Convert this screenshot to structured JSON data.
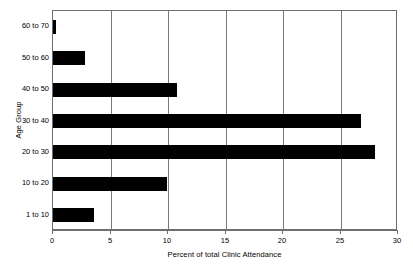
{
  "chart_data": {
    "type": "bar",
    "orientation": "horizontal",
    "title": "",
    "xlabel": "Percent of total Clinic Attendance",
    "ylabel": "Age Group",
    "categories": [
      "1 to 10",
      "10 to 20",
      "20 to 30",
      "30 to 40",
      "40 to 50",
      "50 to 60",
      "60 to 70"
    ],
    "values": [
      3.6,
      9.9,
      28.0,
      26.8,
      10.8,
      2.8,
      0.3
    ],
    "xlim": [
      0,
      30
    ],
    "xticks": [
      0,
      5,
      10,
      15,
      20,
      25,
      30
    ],
    "xtick_labels": [
      "0",
      "5",
      "10",
      "15",
      "20",
      "25",
      "30"
    ],
    "grid": "vertical",
    "legend": "none",
    "bar_color": "#000000",
    "axis_color": "#6e6e6e",
    "background_color": "#ffffff"
  },
  "axes": {
    "x_title": "Percent of total Clinic Attendance",
    "y_title": "Age Group"
  }
}
